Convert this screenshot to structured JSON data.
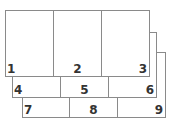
{
  "diagram": {
    "line_color": "#8a8a8a",
    "label_color": "#333333",
    "panels": [
      {
        "name": "back-panel-3",
        "cells": [
          {
            "label": "7",
            "align": "left"
          },
          {
            "label": "8",
            "align": "center"
          },
          {
            "label": "9",
            "align": "right"
          }
        ]
      },
      {
        "name": "middle-panel-2",
        "cells": [
          {
            "label": "4",
            "align": "left"
          },
          {
            "label": "5",
            "align": "center"
          },
          {
            "label": "6",
            "align": "right"
          }
        ]
      },
      {
        "name": "front-panel-1",
        "cells": [
          {
            "label": "1",
            "align": "left"
          },
          {
            "label": "2",
            "align": "center"
          },
          {
            "label": "3",
            "align": "right"
          }
        ]
      }
    ]
  }
}
